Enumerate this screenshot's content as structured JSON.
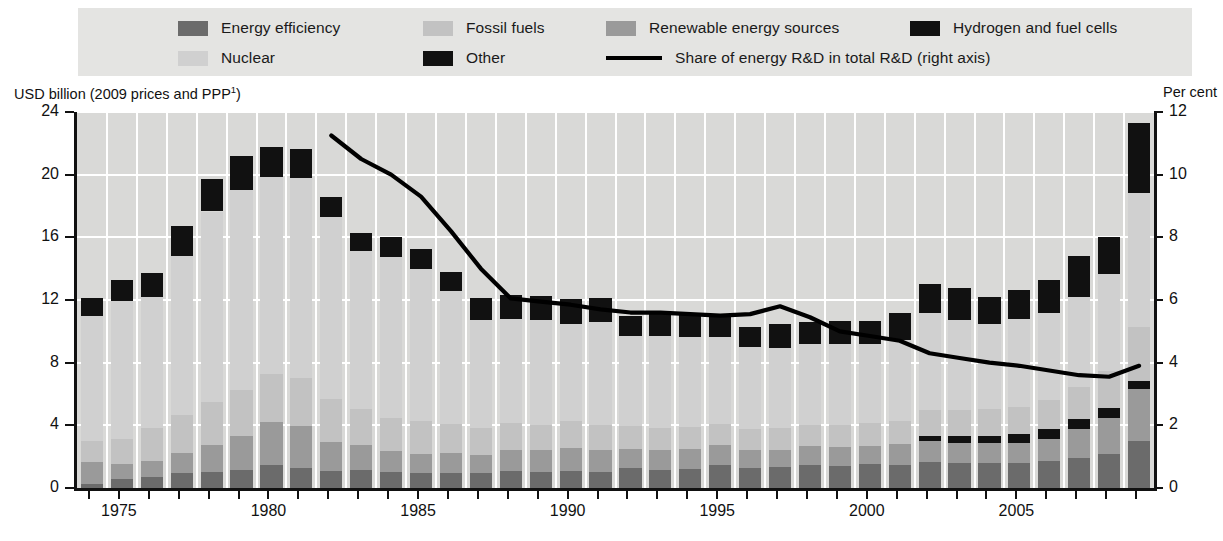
{
  "legend": {
    "rows": [
      [
        {
          "label": "Energy efficiency",
          "swatch": "#6b6b6b",
          "kind": "box"
        },
        {
          "label": "Fossil fuels",
          "swatch": "#c2c2c2",
          "kind": "box"
        },
        {
          "label": "Renewable energy sources",
          "swatch": "#9a9a9a",
          "kind": "box"
        },
        {
          "label": "Hydrogen and fuel cells",
          "swatch": "#111111",
          "kind": "box"
        }
      ],
      [
        {
          "label": "Nuclear",
          "swatch": "#d0d0d0",
          "kind": "box"
        },
        {
          "label": "Other",
          "swatch": "#111111",
          "kind": "box"
        },
        {
          "label": "Share of energy R&D in total R&D (right axis)",
          "swatch": "#000000",
          "kind": "line"
        }
      ]
    ]
  },
  "axes": {
    "left_caption": "USD billion (2009 prices and PPP",
    "left_caption_sup": "1",
    "left_caption_tail": ")",
    "right_caption": "Per cent",
    "left_ticks": [
      "0",
      "4",
      "8",
      "12",
      "16",
      "20",
      "24"
    ],
    "right_ticks": [
      "0",
      "2",
      "4",
      "6",
      "8",
      "10",
      "12"
    ],
    "x_ticks": [
      "1975",
      "1980",
      "1985",
      "1990",
      "1995",
      "2000",
      "2005"
    ]
  },
  "chart_data": {
    "type": "bar",
    "title": "",
    "subtitle": "",
    "xlabel": "",
    "ylabel": "USD billion (2009 prices and PPP)",
    "ylabel_right": "Per cent",
    "ylim": [
      0,
      24
    ],
    "ylim_right": [
      0,
      12
    ],
    "grid": true,
    "legend_position": "top",
    "x": [
      1974,
      1975,
      1976,
      1977,
      1978,
      1979,
      1980,
      1981,
      1982,
      1983,
      1984,
      1985,
      1986,
      1987,
      1988,
      1989,
      1990,
      1991,
      1992,
      1993,
      1994,
      1995,
      1996,
      1997,
      1998,
      1999,
      2000,
      2001,
      2002,
      2003,
      2004,
      2005,
      2006,
      2007,
      2008,
      2009
    ],
    "stack_order": [
      "Energy efficiency",
      "Renewable energy sources",
      "Hydrogen and fuel cells",
      "Fossil fuels",
      "Nuclear",
      "Other"
    ],
    "series": [
      {
        "name": "Energy efficiency",
        "color": "#6b6b6b",
        "values": [
          0.25,
          0.55,
          0.7,
          0.95,
          1.0,
          1.15,
          1.45,
          1.25,
          1.1,
          1.15,
          1.05,
          0.95,
          0.95,
          0.95,
          1.1,
          1.05,
          1.1,
          1.05,
          1.25,
          1.15,
          1.2,
          1.45,
          1.3,
          1.35,
          1.45,
          1.4,
          1.55,
          1.5,
          1.65,
          1.6,
          1.6,
          1.6,
          1.7,
          1.9,
          2.15,
          3.0
        ]
      },
      {
        "name": "Renewable energy sources",
        "color": "#9a9a9a",
        "values": [
          1.4,
          1.0,
          1.05,
          1.3,
          1.75,
          2.2,
          2.75,
          2.7,
          1.85,
          1.6,
          1.3,
          1.25,
          1.3,
          1.15,
          1.35,
          1.4,
          1.45,
          1.4,
          1.25,
          1.3,
          1.3,
          1.3,
          1.15,
          1.1,
          1.25,
          1.2,
          1.15,
          1.3,
          1.35,
          1.3,
          1.3,
          1.3,
          1.45,
          1.85,
          2.35,
          3.3
        ]
      },
      {
        "name": "Hydrogen and fuel cells",
        "color": "#111111",
        "values": [
          0,
          0,
          0,
          0,
          0,
          0,
          0,
          0,
          0,
          0,
          0,
          0,
          0,
          0,
          0,
          0,
          0,
          0,
          0,
          0,
          0,
          0,
          0,
          0,
          0,
          0,
          0,
          0,
          0.35,
          0.4,
          0.45,
          0.55,
          0.6,
          0.65,
          0.6,
          0.55
        ]
      },
      {
        "name": "Fossil fuels",
        "color": "#c2c2c2",
        "values": [
          1.35,
          1.6,
          2.1,
          2.4,
          2.75,
          2.9,
          3.1,
          3.1,
          2.75,
          2.3,
          2.15,
          2.05,
          1.85,
          1.75,
          1.7,
          1.6,
          1.7,
          1.6,
          1.45,
          1.4,
          1.4,
          1.35,
          1.3,
          1.35,
          1.35,
          1.4,
          1.45,
          1.45,
          1.6,
          1.65,
          1.7,
          1.75,
          1.85,
          2.05,
          2.35,
          3.4
        ]
      },
      {
        "name": "Nuclear",
        "color": "#d0d0d0",
        "values": [
          7.95,
          8.8,
          8.35,
          10.15,
          12.15,
          12.8,
          12.55,
          12.75,
          11.6,
          10.1,
          10.25,
          9.75,
          8.5,
          6.9,
          6.65,
          6.65,
          6.2,
          6.55,
          5.75,
          5.85,
          5.75,
          5.55,
          5.25,
          5.15,
          5.15,
          5.2,
          5.05,
          5.2,
          6.2,
          5.8,
          5.4,
          5.6,
          5.55,
          5.75,
          6.2,
          8.55
        ]
      },
      {
        "name": "Other",
        "color": "#111111",
        "values": [
          1.15,
          1.35,
          1.55,
          1.9,
          2.05,
          2.15,
          1.9,
          1.85,
          1.3,
          1.1,
          1.25,
          1.25,
          1.2,
          1.35,
          1.5,
          1.55,
          1.6,
          1.5,
          1.3,
          1.4,
          1.4,
          1.35,
          1.3,
          1.55,
          1.4,
          1.45,
          1.45,
          1.7,
          1.9,
          2.0,
          1.75,
          1.85,
          2.1,
          2.6,
          2.4,
          4.5
        ]
      }
    ],
    "line_series": {
      "name": "Share of energy R&D in total R&D (right axis)",
      "color": "#000000",
      "axis": "right",
      "unit": "per cent",
      "x": [
        1982,
        1983,
        1984,
        1985,
        1986,
        1987,
        1988,
        1989,
        1990,
        1991,
        1992,
        1993,
        1994,
        1995,
        1996,
        1997,
        1998,
        1999,
        2000,
        2001,
        2002,
        2003,
        2004,
        2005,
        2006,
        2007,
        2008,
        2009
      ],
      "values": [
        11.25,
        10.5,
        10.0,
        9.3,
        8.2,
        7.0,
        6.05,
        5.95,
        5.85,
        5.7,
        5.6,
        5.6,
        5.55,
        5.5,
        5.55,
        5.8,
        5.45,
        5.0,
        4.85,
        4.7,
        4.3,
        4.15,
        4.0,
        3.9,
        3.75,
        3.6,
        3.55,
        3.9
      ]
    }
  }
}
